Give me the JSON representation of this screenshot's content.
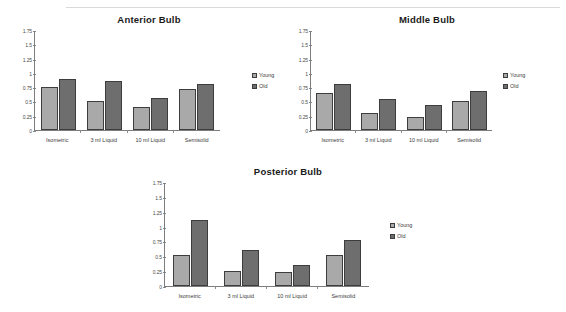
{
  "figure": {
    "axis": {
      "yticks": [
        "0",
        "0.25",
        "0.5",
        "0.75",
        "1",
        "1.25",
        "1.5",
        "1.75"
      ],
      "ymin": 0,
      "ymax": 1.75
    },
    "legend": {
      "young_label": "Young",
      "old_label": "Old",
      "young_color": "#a9a9a9",
      "old_color": "#6e6e6e"
    }
  },
  "chart_data": [
    {
      "type": "bar",
      "title": "Anterior Bulb",
      "categories": [
        "Isometric",
        "3 ml Liquid",
        "10 ml Liquid",
        "Semisolid"
      ],
      "series": [
        {
          "name": "Young",
          "values": [
            0.76,
            0.5,
            0.4,
            0.71
          ]
        },
        {
          "name": "Old",
          "values": [
            0.9,
            0.85,
            0.56,
            0.8
          ]
        }
      ],
      "xlabel": "",
      "ylabel": "",
      "ylim": [
        0,
        1.75
      ],
      "yticks": [
        0,
        0.25,
        0.5,
        0.75,
        1,
        1.25,
        1.5,
        1.75
      ],
      "grid": false,
      "legend_position": "right"
    },
    {
      "type": "bar",
      "title": "Middle Bulb",
      "categories": [
        "Isometric",
        "3 ml Liquid",
        "10 ml Liquid",
        "Semisolid"
      ],
      "series": [
        {
          "name": "Young",
          "values": [
            0.65,
            0.3,
            0.23,
            0.5
          ]
        },
        {
          "name": "Old",
          "values": [
            0.8,
            0.55,
            0.43,
            0.68
          ]
        }
      ],
      "xlabel": "",
      "ylabel": "",
      "ylim": [
        0,
        1.75
      ],
      "yticks": [
        0,
        0.25,
        0.5,
        0.75,
        1,
        1.25,
        1.5,
        1.75
      ],
      "grid": false,
      "legend_position": "right"
    },
    {
      "type": "bar",
      "title": "Posterior Bulb",
      "categories": [
        "Isometric",
        "3 ml Liquid",
        "10 ml Liquid",
        "Semisolid"
      ],
      "series": [
        {
          "name": "Young",
          "values": [
            0.52,
            0.26,
            0.24,
            0.52
          ]
        },
        {
          "name": "Old",
          "values": [
            1.11,
            0.6,
            0.35,
            0.77
          ]
        }
      ],
      "xlabel": "",
      "ylabel": "",
      "ylim": [
        0,
        1.75
      ],
      "yticks": [
        0,
        0.25,
        0.5,
        0.75,
        1,
        1.25,
        1.5,
        1.75
      ],
      "grid": false,
      "legend_position": "right"
    }
  ]
}
